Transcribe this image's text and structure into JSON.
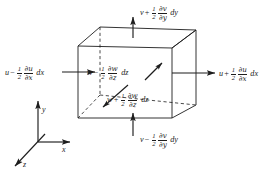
{
  "figure": {
    "name": "control-volume-mass-flux-diagram",
    "colors": {
      "ink": "#1d1d1d",
      "background": "#ffffff"
    }
  },
  "flux_labels": {
    "top": {
      "id": "top-face-v-out",
      "base": "v",
      "operator": "+",
      "coefficient_num": "1",
      "coefficient_den": "2",
      "partial_num": "∂v",
      "partial_den": "∂y",
      "differential": "dy",
      "full_text": "v + 1/2 ∂v/∂y dy"
    },
    "bottom": {
      "id": "bottom-face-v-in",
      "base": "v",
      "operator": "−",
      "coefficient_num": "1",
      "coefficient_den": "2",
      "partial_num": "∂v",
      "partial_den": "∂y",
      "differential": "dy",
      "full_text": "v − 1/2 ∂v/∂y dy"
    },
    "left": {
      "id": "left-face-u-in",
      "base": "u",
      "operator": "−",
      "coefficient_num": "1",
      "coefficient_den": "2",
      "partial_num": "∂u",
      "partial_den": "∂x",
      "differential": "dx",
      "full_text": "u − 1/2 ∂u/∂x dx"
    },
    "right": {
      "id": "right-face-u-out",
      "base": "u",
      "operator": "+",
      "coefficient_num": "1",
      "coefficient_den": "2",
      "partial_num": "∂u",
      "partial_den": "∂x",
      "differential": "dx",
      "full_text": "u + 1/2 ∂u/∂x dx"
    },
    "back": {
      "id": "back-face-w-in",
      "base": "w",
      "operator": "−",
      "coefficient_num": "1",
      "coefficient_den": "2",
      "partial_num": "∂w",
      "partial_den": "∂z",
      "differential": "dz",
      "full_text": "w − 1/2 ∂w/∂z dz"
    },
    "front": {
      "id": "front-face-w-out",
      "base": "w",
      "operator": "+",
      "coefficient_num": "1",
      "coefficient_den": "2",
      "partial_num": "∂w",
      "partial_den": "∂z",
      "differential": "dz",
      "full_text": "w + 1/2 ∂w/∂z dz"
    }
  },
  "axes": {
    "x": "x",
    "y": "y",
    "z": "z"
  }
}
